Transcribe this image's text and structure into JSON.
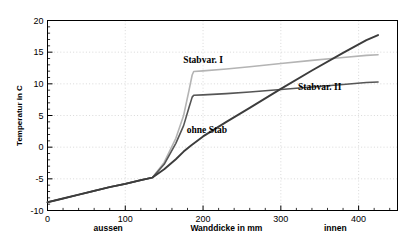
{
  "chart_data": {
    "type": "line",
    "title": "",
    "xlabel": "Wanddicke in mm",
    "ylabel": "Temperatur in C",
    "xlim": [
      0,
      450
    ],
    "ylim": [
      -10,
      20
    ],
    "xticks": [
      0,
      100,
      200,
      300,
      400
    ],
    "yticks": [
      -10,
      -5,
      0,
      5,
      10,
      15,
      20
    ],
    "xtick_labels": [
      "0",
      "100",
      "200",
      "300",
      "400"
    ],
    "ytick_labels": [
      "-10",
      "-5",
      "0",
      "5",
      "10",
      "15",
      "20"
    ],
    "grid": true,
    "legend_position": "inline-annotations",
    "annotations": [
      {
        "text": "aussen",
        "x": 78,
        "y": -13.2
      },
      {
        "text": "Wanddicke in mm",
        "x": 230,
        "y": -13.2
      },
      {
        "text": "innen",
        "x": 370,
        "y": -13.2
      }
    ],
    "series": [
      {
        "name": "Stabvar. I",
        "color": "#b4b4b4",
        "width": 1.6,
        "label_x": 200,
        "label_y": 13.3,
        "x": [
          0,
          20,
          40,
          60,
          80,
          100,
          120,
          135,
          150,
          165,
          175,
          182,
          186,
          188,
          200,
          230,
          260,
          300,
          340,
          380,
          410,
          425
        ],
        "y": [
          -8.7,
          -8.1,
          -7.5,
          -6.9,
          -6.3,
          -5.8,
          -5.2,
          -4.8,
          -2.4,
          1.4,
          5.0,
          9.0,
          11.4,
          11.95,
          12.05,
          12.35,
          12.7,
          13.2,
          13.7,
          14.15,
          14.5,
          14.6
        ]
      },
      {
        "name": "Stabvar. II",
        "color": "#565656",
        "width": 1.6,
        "label_x": 350,
        "label_y": 9.0,
        "x": [
          0,
          20,
          40,
          60,
          80,
          100,
          120,
          135,
          150,
          165,
          175,
          182,
          186,
          188,
          200,
          230,
          260,
          300,
          340,
          380,
          410,
          425
        ],
        "y": [
          -8.7,
          -8.1,
          -7.5,
          -6.9,
          -6.3,
          -5.8,
          -5.2,
          -4.8,
          -2.7,
          0.6,
          3.4,
          6.3,
          7.9,
          8.2,
          8.25,
          8.45,
          8.7,
          9.1,
          9.5,
          9.9,
          10.2,
          10.3
        ]
      },
      {
        "name": "ohne Stab",
        "color": "#3c3c3c",
        "width": 1.9,
        "label_x": 205,
        "label_y": 2.2,
        "x": [
          0,
          20,
          40,
          60,
          80,
          100,
          120,
          135,
          150,
          165,
          175,
          185,
          200,
          230,
          260,
          300,
          340,
          380,
          410,
          425
        ],
        "y": [
          -8.7,
          -8.1,
          -7.5,
          -6.9,
          -6.3,
          -5.8,
          -5.2,
          -4.8,
          -3.5,
          -1.9,
          -0.7,
          0.3,
          1.7,
          4.0,
          6.2,
          9.2,
          12.1,
          14.9,
          16.9,
          17.7
        ]
      }
    ]
  }
}
